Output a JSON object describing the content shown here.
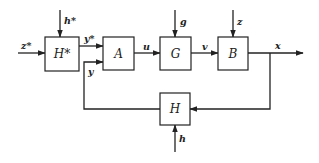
{
  "diagram": {
    "type": "block-diagram",
    "blocks": [
      {
        "id": "Hstar",
        "label": "H*",
        "x": 45,
        "y": 37,
        "w": 34,
        "h": 34
      },
      {
        "id": "A",
        "label": "A",
        "x": 103,
        "y": 37,
        "w": 31,
        "h": 33
      },
      {
        "id": "G",
        "label": "G",
        "x": 160,
        "y": 37,
        "w": 31,
        "h": 33
      },
      {
        "id": "B",
        "label": "B",
        "x": 218,
        "y": 37,
        "w": 30,
        "h": 33
      },
      {
        "id": "H",
        "label": "H",
        "x": 160,
        "y": 93,
        "w": 30,
        "h": 32
      }
    ],
    "signals": {
      "z_star": "z*",
      "h_star": "h*",
      "y_star": "y*",
      "y": "y",
      "u": "u",
      "g": "g",
      "v": "v",
      "z": "z",
      "x": "x",
      "h": "h"
    }
  }
}
